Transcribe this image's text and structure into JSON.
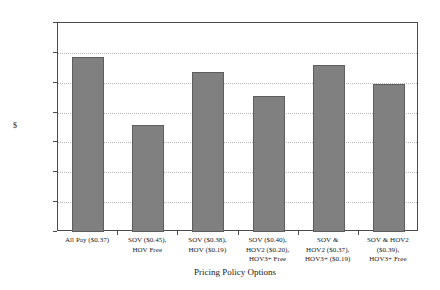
{
  "chart_data": {
    "type": "bar",
    "title": "",
    "xlabel": "Pricing Policy Options",
    "ylabel": "$",
    "ylim": [
      0,
      7000
    ],
    "ytick_labels": [
      "7000",
      "6000",
      "5000",
      "4000",
      "3000",
      "2000",
      "1000",
      "0"
    ],
    "ytick_values": [
      7000,
      6000,
      5000,
      4000,
      3000,
      2000,
      1000,
      0
    ],
    "grid": "horizontal-dotted",
    "legend": "none",
    "bar_color": "#808080",
    "bar_border_color": "#5e5e5e",
    "categories": [
      "All Pay ($0.37)",
      "SOV ($0.45), HOV Free",
      "SOV ($0.38), HOV ($0.19)",
      "SOV ($0.40), HOV2 ($0.20), HOV3+ Free",
      "SOV & HOV2 ($0.37), HOV3+ ($0.19)",
      "SOV & HOV2 ($0.39), HOV3+ Free"
    ],
    "category_lines": [
      [
        "All Pay ($0.37)"
      ],
      [
        "SOV ($0.45),",
        "HOV Free"
      ],
      [
        "SOV ($0.38),",
        "HOV ($0.19)"
      ],
      [
        "SOV ($0.40),",
        "HOV2 ($0.20),",
        "HOV3+ Free"
      ],
      [
        "SOV &",
        "HOV2 ($0.37),",
        "HOV3+ ($0.19)"
      ],
      [
        "SOV & HOV2",
        "($0.39),",
        "HOV3+ Free"
      ]
    ],
    "values": [
      5870,
      3600,
      5360,
      4570,
      5600,
      4950
    ]
  }
}
